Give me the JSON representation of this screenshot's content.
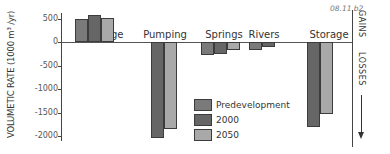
{
  "figure_id": "08.11.b2",
  "chart_data": {
    "type": "bar",
    "title": "",
    "xlabel": "",
    "ylabel": "VOLUMETIC RATE (1000 m³ /yr)",
    "ylim": [
      -2100,
      600
    ],
    "yticks": [
      500,
      0,
      -500,
      -1000,
      -1500,
      -2000
    ],
    "grid": false,
    "legend_position": "bottom-center (inside)",
    "categories": [
      "Recharge",
      "Pumping",
      "Springs",
      "Rivers",
      "Storage"
    ],
    "series": [
      {
        "name": "Predevelopment",
        "color": "#7a7a7a",
        "values": [
          480,
          0,
          -280,
          -170,
          0
        ]
      },
      {
        "name": "2000",
        "color": "#666666",
        "values": [
          580,
          -2050,
          -250,
          -110,
          -1800
        ]
      },
      {
        "name": "2050",
        "color": "#a9a9a9",
        "values": [
          520,
          -1850,
          -180,
          0,
          -1530
        ]
      }
    ],
    "annotations": {
      "gains_label": "GAINS",
      "losses_label": "LOSSES"
    }
  }
}
